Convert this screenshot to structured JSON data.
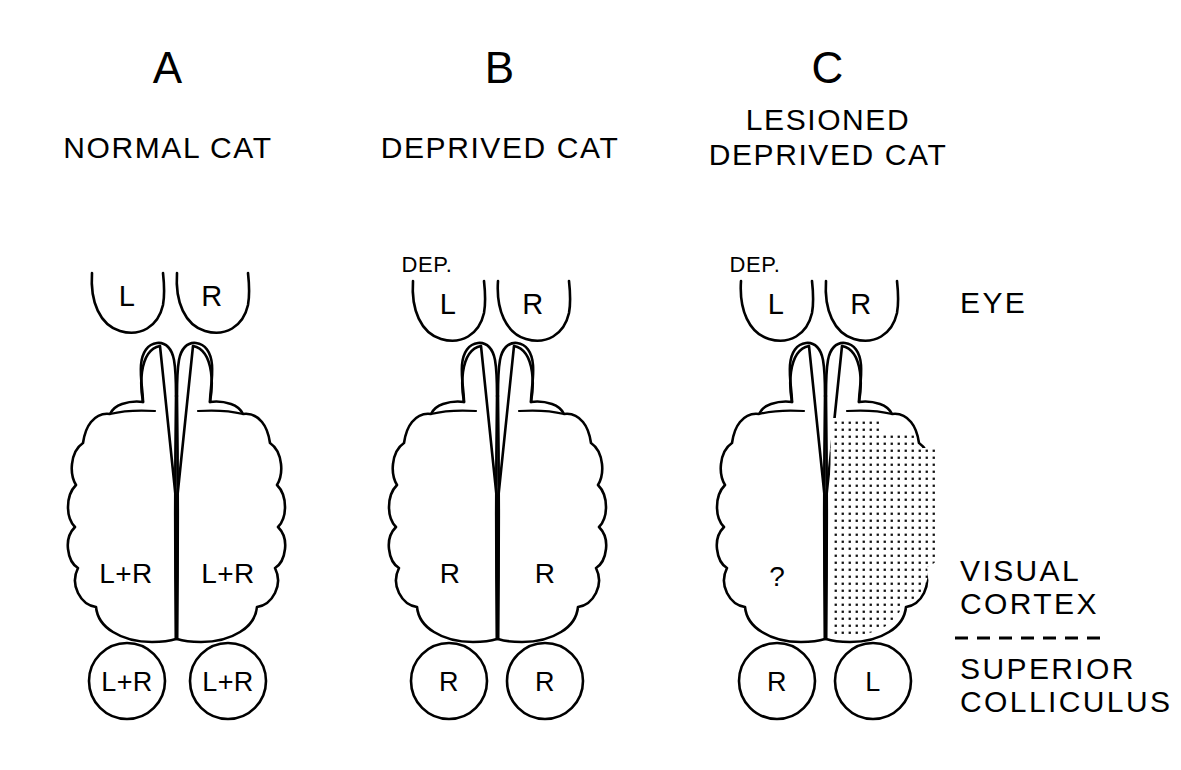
{
  "figure": {
    "background_color": "#ffffff",
    "ink_color": "#000000",
    "caption_note": ""
  },
  "panels": [
    {
      "letter": "A",
      "title_lines": [
        "NORMAL CAT"
      ],
      "eyes": [
        {
          "label": "L",
          "side": "left",
          "deprived_tag": ""
        },
        {
          "label": "R",
          "side": "right",
          "deprived_tag": ""
        }
      ],
      "cortex": [
        {
          "hemisphere": "left",
          "label": "L+R",
          "lesioned": false
        },
        {
          "hemisphere": "right",
          "label": "L+R",
          "lesioned": false
        }
      ],
      "colliculi": [
        {
          "side": "left",
          "label": "L+R"
        },
        {
          "side": "right",
          "label": "L+R"
        }
      ]
    },
    {
      "letter": "B",
      "title_lines": [
        "DEPRIVED CAT"
      ],
      "eyes": [
        {
          "label": "L",
          "side": "left",
          "deprived_tag": "DEP."
        },
        {
          "label": "R",
          "side": "right",
          "deprived_tag": ""
        }
      ],
      "cortex": [
        {
          "hemisphere": "left",
          "label": "R",
          "lesioned": false
        },
        {
          "hemisphere": "right",
          "label": "R",
          "lesioned": false
        }
      ],
      "colliculi": [
        {
          "side": "left",
          "label": "R"
        },
        {
          "side": "right",
          "label": "R"
        }
      ]
    },
    {
      "letter": "C",
      "title_lines": [
        "LESIONED",
        "DEPRIVED CAT"
      ],
      "eyes": [
        {
          "label": "L",
          "side": "left",
          "deprived_tag": "DEP."
        },
        {
          "label": "R",
          "side": "right",
          "deprived_tag": ""
        }
      ],
      "cortex": [
        {
          "hemisphere": "left",
          "label": "?",
          "lesioned": false
        },
        {
          "hemisphere": "right",
          "label": "",
          "lesioned": true
        }
      ],
      "colliculi": [
        {
          "side": "left",
          "label": "R"
        },
        {
          "side": "right",
          "label": "L"
        }
      ]
    }
  ],
  "row_labels": {
    "eye": "EYE",
    "visual_cortex_line1": "VISUAL",
    "visual_cortex_line2": "CORTEX",
    "superior_colliculus_line1": "SUPERIOR",
    "superior_colliculus_line2": "COLLICULUS"
  }
}
